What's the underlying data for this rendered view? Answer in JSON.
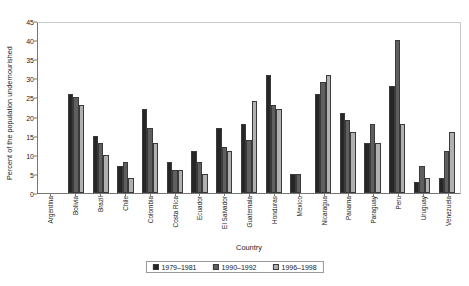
{
  "chart_data": {
    "type": "bar",
    "title": "",
    "xlabel": "Country",
    "ylabel": "Percent of the population undernourished",
    "ylim": [
      0,
      45
    ],
    "ytick_step": 5,
    "yticks": [
      0,
      5,
      10,
      15,
      20,
      25,
      30,
      35,
      40,
      45
    ],
    "grid": false,
    "legend_position": "bottom",
    "categories": [
      "Argentina",
      "Bolivia",
      "Brazil",
      "Chile",
      "Colombia",
      "Costa Rica",
      "Ecuador",
      "El Salvador",
      "Guatemala",
      "Honduras",
      "Mexico",
      "Nicaragua",
      "Panama",
      "Paraguay",
      "Peru",
      "Uruguay",
      "Venezuela"
    ],
    "series": [
      {
        "name": "1979–1981",
        "color": "#262626",
        "values": [
          null,
          26,
          15,
          7,
          22,
          8,
          11,
          17,
          18,
          31,
          5,
          26,
          21,
          13,
          28,
          3,
          4
        ]
      },
      {
        "name": "1990–1992",
        "color": "#5f5f5f",
        "values": [
          null,
          25,
          13,
          8,
          17,
          6,
          8,
          12,
          14,
          23,
          5,
          29,
          19,
          18,
          40,
          7,
          11
        ]
      },
      {
        "name": "1996–1998",
        "color": "#b0b0b0",
        "values": [
          null,
          23,
          10,
          4,
          13,
          6,
          5,
          11,
          24,
          22,
          null,
          31,
          16,
          13,
          18,
          4,
          16
        ]
      }
    ]
  },
  "legend": {
    "items": [
      {
        "label": "1979–1981",
        "swatch": "s0"
      },
      {
        "label": "1990–1992",
        "swatch": "s1"
      },
      {
        "label": "1996–1998",
        "swatch": "s2"
      }
    ]
  }
}
